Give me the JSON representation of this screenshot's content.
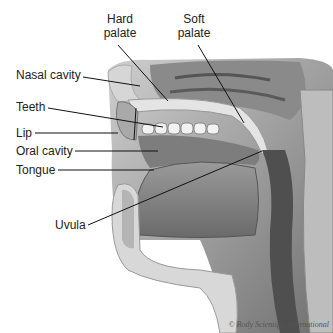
{
  "diagram": {
    "labels": [
      {
        "id": "hard-palate",
        "text_line1": "Hard",
        "text_line2": "palate"
      },
      {
        "id": "soft-palate",
        "text_line1": "Soft",
        "text_line2": "palate"
      },
      {
        "id": "nasal-cavity",
        "text": "Nasal cavity"
      },
      {
        "id": "teeth",
        "text": "Teeth"
      },
      {
        "id": "lip",
        "text": "Lip"
      },
      {
        "id": "oral-cavity",
        "text": "Oral cavity"
      },
      {
        "id": "tongue",
        "text": "Tongue"
      },
      {
        "id": "uvula",
        "text": "Uvula"
      }
    ],
    "credit": "© Body Scientific International"
  }
}
